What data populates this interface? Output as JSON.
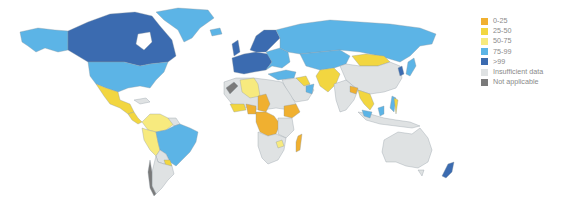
{
  "legend": {
    "items": [
      {
        "label": "0-25",
        "color": "#f0b030"
      },
      {
        "label": "25-50",
        "color": "#f2d640"
      },
      {
        "label": "50-75",
        "color": "#f7ea7e"
      },
      {
        "label": "75-99",
        "color": "#5cb4e6"
      },
      {
        "label": ">99",
        "color": "#3b6bb0"
      },
      {
        "label": "Insufficient data",
        "color": "#dfe2e3"
      },
      {
        "label": "Not applicable",
        "color": "#7a7a7a"
      }
    ]
  },
  "map": {
    "regions": [
      {
        "name": "Canada",
        "category": ">99"
      },
      {
        "name": "Alaska (USA)",
        "category": "75-99"
      },
      {
        "name": "United States",
        "category": "75-99"
      },
      {
        "name": "Greenland",
        "category": "75-99"
      },
      {
        "name": "Mexico",
        "category": "25-50"
      },
      {
        "name": "Central America",
        "category": "25-50"
      },
      {
        "name": "Colombia/Venezuela",
        "category": "50-75"
      },
      {
        "name": "Peru/Ecuador",
        "category": "50-75"
      },
      {
        "name": "Brazil",
        "category": "75-99"
      },
      {
        "name": "Southern South America",
        "category": "Insufficient data"
      },
      {
        "name": "Western Europe",
        "category": ">99"
      },
      {
        "name": "Scandinavia",
        "category": ">99"
      },
      {
        "name": "Russia",
        "category": "75-99"
      },
      {
        "name": "Central Asia",
        "category": "75-99"
      },
      {
        "name": "Mongolia",
        "category": "25-50"
      },
      {
        "name": "China",
        "category": "Insufficient data"
      },
      {
        "name": "Japan",
        "category": "75-99"
      },
      {
        "name": "Korea",
        "category": ">99"
      },
      {
        "name": "Algeria",
        "category": "50-75"
      },
      {
        "name": "North Africa",
        "category": "Insufficient data"
      },
      {
        "name": "Afghanistan/Pakistan",
        "category": "25-50"
      },
      {
        "name": "India",
        "category": "Insufficient data"
      },
      {
        "name": "Sahel",
        "category": "0-25"
      },
      {
        "name": "Central Africa",
        "category": "0-25"
      },
      {
        "name": "Ethiopia",
        "category": "0-25"
      },
      {
        "name": "Madagascar",
        "category": "0-25"
      },
      {
        "name": "Southern Africa",
        "category": "Insufficient data"
      },
      {
        "name": "Southeast Asia",
        "category": "25-50"
      },
      {
        "name": "Indonesia",
        "category": "Insufficient data"
      },
      {
        "name": "Australia",
        "category": "Insufficient data"
      },
      {
        "name": "New Zealand",
        "category": ">99"
      }
    ]
  }
}
